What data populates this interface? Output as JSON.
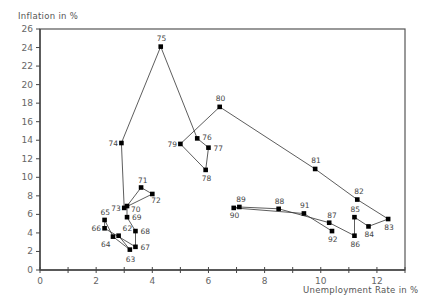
{
  "chart_data": {
    "type": "line",
    "title": "",
    "xlabel": "Unemployment Rate in %",
    "ylabel": "Inflation in %",
    "xlim": [
      0,
      13
    ],
    "ylim": [
      0,
      26
    ],
    "xticks": [
      0,
      2,
      4,
      6,
      8,
      10,
      12
    ],
    "xminor": [
      1,
      3,
      5,
      7,
      9,
      11,
      13
    ],
    "yticks": [
      0,
      2,
      4,
      6,
      8,
      10,
      12,
      14,
      16,
      18,
      20,
      22,
      24,
      26
    ],
    "grid": false,
    "legend": null,
    "series": [
      {
        "name": "Phillips curve 1962-1992",
        "connected": true,
        "points": [
          {
            "label": "62",
            "x": 2.8,
            "y": 3.7,
            "lx": 4,
            "ly": -5
          },
          {
            "label": "63",
            "x": 3.2,
            "y": 2.2,
            "lx": -4,
            "ly": 12
          },
          {
            "label": "64",
            "x": 2.6,
            "y": 3.6,
            "lx": -12,
            "ly": 10
          },
          {
            "label": "65",
            "x": 2.3,
            "y": 5.4,
            "lx": -4,
            "ly": -5
          },
          {
            "label": "66",
            "x": 2.3,
            "y": 4.5,
            "lx": -13,
            "ly": 3
          },
          {
            "label": "67",
            "x": 3.4,
            "y": 2.5,
            "lx": 5,
            "ly": 3
          },
          {
            "label": "68",
            "x": 3.4,
            "y": 4.2,
            "lx": 5,
            "ly": 3
          },
          {
            "label": "69",
            "x": 3.1,
            "y": 5.7,
            "lx": 5,
            "ly": 3
          },
          {
            "label": "70",
            "x": 3.1,
            "y": 6.9,
            "lx": 4,
            "ly": 6
          },
          {
            "label": "71",
            "x": 3.6,
            "y": 8.9,
            "lx": -3,
            "ly": -5
          },
          {
            "label": "72",
            "x": 4.0,
            "y": 8.2,
            "lx": -1,
            "ly": 9
          },
          {
            "label": "73",
            "x": 3.0,
            "y": 6.7,
            "lx": -13,
            "ly": 3
          },
          {
            "label": "74",
            "x": 2.9,
            "y": 13.7,
            "lx": -13,
            "ly": 3
          },
          {
            "label": "75",
            "x": 4.3,
            "y": 24.1,
            "lx": -4,
            "ly": -6
          },
          {
            "label": "76",
            "x": 5.6,
            "y": 14.2,
            "lx": 5,
            "ly": 2
          },
          {
            "label": "77",
            "x": 6.0,
            "y": 13.2,
            "lx": 5,
            "ly": 3
          },
          {
            "label": "78",
            "x": 5.9,
            "y": 10.8,
            "lx": -4,
            "ly": 11
          },
          {
            "label": "79",
            "x": 5.0,
            "y": 13.6,
            "lx": -13,
            "ly": 3
          },
          {
            "label": "80",
            "x": 6.4,
            "y": 17.6,
            "lx": -4,
            "ly": -6
          },
          {
            "label": "81",
            "x": 9.8,
            "y": 10.9,
            "lx": -4,
            "ly": -6
          },
          {
            "label": "82",
            "x": 11.3,
            "y": 7.6,
            "lx": -3,
            "ly": -6
          },
          {
            "label": "83",
            "x": 12.4,
            "y": 5.5,
            "lx": -4,
            "ly": 11
          },
          {
            "label": "84",
            "x": 11.7,
            "y": 4.7,
            "lx": -4,
            "ly": 11
          },
          {
            "label": "85",
            "x": 11.2,
            "y": 5.7,
            "lx": -4,
            "ly": -5
          },
          {
            "label": "86",
            "x": 11.2,
            "y": 3.7,
            "lx": -4,
            "ly": 11
          },
          {
            "label": "87",
            "x": 10.3,
            "y": 5.1,
            "lx": -2,
            "ly": -5
          },
          {
            "label": "88",
            "x": 8.5,
            "y": 6.6,
            "lx": -4,
            "ly": -5
          },
          {
            "label": "89",
            "x": 7.1,
            "y": 6.8,
            "lx": -3,
            "ly": -5
          },
          {
            "label": "90",
            "x": 6.9,
            "y": 6.7,
            "lx": -4,
            "ly": 10
          },
          {
            "label": "91",
            "x": 9.4,
            "y": 6.1,
            "lx": -4,
            "ly": -5
          },
          {
            "label": "92",
            "x": 10.4,
            "y": 4.2,
            "lx": -4,
            "ly": 11
          }
        ]
      }
    ]
  },
  "layout": {
    "plot_left": 40,
    "plot_right": 405,
    "plot_top": 29,
    "plot_bottom": 270
  }
}
